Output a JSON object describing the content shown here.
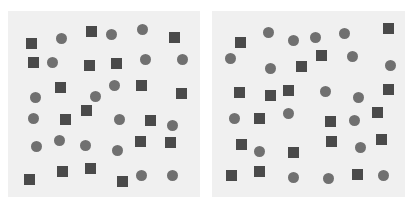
{
  "colors": {
    "background": "#ffffff",
    "panel": "#f0f0f0",
    "square": "#4a4a4a",
    "circle": "#707070"
  },
  "panels": [
    {
      "name": "left-panel",
      "box": [
        8,
        11,
        192,
        186
      ],
      "shapes": [
        [
          "square",
          31,
          43
        ],
        [
          "circle",
          61,
          38
        ],
        [
          "square",
          91,
          31
        ],
        [
          "circle",
          111,
          34
        ],
        [
          "circle",
          142,
          29
        ],
        [
          "square",
          174,
          37
        ],
        [
          "square",
          33,
          62
        ],
        [
          "circle",
          52,
          62
        ],
        [
          "square",
          89,
          65
        ],
        [
          "square",
          116,
          63
        ],
        [
          "circle",
          145,
          59
        ],
        [
          "circle",
          182,
          59
        ],
        [
          "square",
          60,
          87
        ],
        [
          "circle",
          35,
          97
        ],
        [
          "circle",
          95,
          96
        ],
        [
          "circle",
          114,
          85
        ],
        [
          "square",
          141,
          85
        ],
        [
          "square",
          181,
          93
        ],
        [
          "circle",
          33,
          118
        ],
        [
          "square",
          65,
          119
        ],
        [
          "square",
          86,
          110
        ],
        [
          "circle",
          119,
          119
        ],
        [
          "square",
          150,
          120
        ],
        [
          "circle",
          172,
          125
        ],
        [
          "circle",
          36,
          146
        ],
        [
          "circle",
          59,
          140
        ],
        [
          "circle",
          85,
          145
        ],
        [
          "circle",
          117,
          150
        ],
        [
          "square",
          140,
          141
        ],
        [
          "square",
          170,
          142
        ],
        [
          "square",
          29,
          179
        ],
        [
          "square",
          62,
          171
        ],
        [
          "square",
          90,
          168
        ],
        [
          "square",
          122,
          181
        ],
        [
          "circle",
          141,
          175
        ],
        [
          "circle",
          172,
          175
        ]
      ]
    },
    {
      "name": "right-panel",
      "box": [
        212,
        11,
        193,
        186
      ],
      "shapes": [
        [
          "square",
          240,
          42
        ],
        [
          "circle",
          268,
          32
        ],
        [
          "circle",
          293,
          40
        ],
        [
          "circle",
          315,
          37
        ],
        [
          "circle",
          344,
          33
        ],
        [
          "square",
          388,
          28
        ],
        [
          "circle",
          230,
          58
        ],
        [
          "circle",
          270,
          68
        ],
        [
          "square",
          301,
          66
        ],
        [
          "square",
          321,
          55
        ],
        [
          "circle",
          352,
          56
        ],
        [
          "circle",
          390,
          65
        ],
        [
          "square",
          239,
          92
        ],
        [
          "square",
          270,
          95
        ],
        [
          "square",
          288,
          90
        ],
        [
          "circle",
          325,
          91
        ],
        [
          "circle",
          358,
          97
        ],
        [
          "square",
          388,
          89
        ],
        [
          "circle",
          234,
          118
        ],
        [
          "square",
          259,
          118
        ],
        [
          "circle",
          288,
          113
        ],
        [
          "square",
          330,
          121
        ],
        [
          "circle",
          354,
          120
        ],
        [
          "square",
          377,
          112
        ],
        [
          "square",
          241,
          144
        ],
        [
          "circle",
          259,
          151
        ],
        [
          "square",
          293,
          152
        ],
        [
          "square",
          331,
          141
        ],
        [
          "circle",
          360,
          147
        ],
        [
          "square",
          381,
          139
        ],
        [
          "square",
          231,
          175
        ],
        [
          "square",
          259,
          171
        ],
        [
          "circle",
          293,
          177
        ],
        [
          "circle",
          328,
          178
        ],
        [
          "square",
          357,
          174
        ],
        [
          "circle",
          383,
          175
        ]
      ]
    }
  ]
}
